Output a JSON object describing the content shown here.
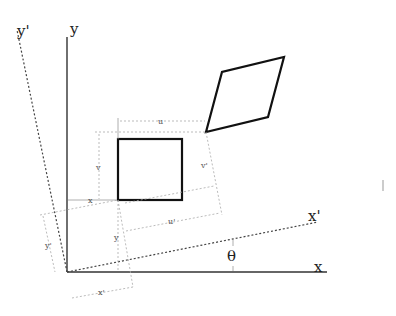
{
  "diagram": {
    "labels": {
      "y_axis": "y",
      "x_axis": "x",
      "y_prime_axis": "y'",
      "x_prime_axis": "x'",
      "theta": "θ",
      "u": "u",
      "v": "v",
      "u_prime": "u'",
      "v_prime": "v'",
      "x_offset": "x",
      "y_offset": "y",
      "x_prime_offset": "x'",
      "y_prime_offset": "y'"
    },
    "colors": {
      "line": "#111111",
      "axis": "#333333",
      "dimension": "#aaaaaa",
      "background": "#ffffff"
    }
  }
}
